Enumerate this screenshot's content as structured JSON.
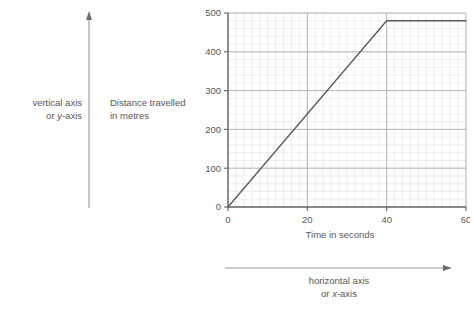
{
  "annotations": {
    "vertical": {
      "line1": "vertical axis",
      "line2_prefix": "or ",
      "line2_italic": "y",
      "line2_suffix": "-axis"
    },
    "horizontal": {
      "line1": "horizontal axis",
      "line2_prefix": "or ",
      "line2_italic": "x",
      "line2_suffix": "-axis"
    },
    "vertical_arrow_icon": "up-arrow-icon",
    "horizontal_arrow_icon": "right-arrow-icon"
  },
  "colors": {
    "text": "#58585b",
    "major_grid": "#b6b6bb",
    "minor_grid": "#e9e9ee",
    "axis": "#6d6d70",
    "series_line": "#58585b",
    "annotation_arrow": "#9a9a9e",
    "background": "#ffffff"
  },
  "chart_data": {
    "type": "line",
    "title": "",
    "xlabel": "Time in seconds",
    "ylabel": "Distance travelled in metres",
    "ylabel_line1": "Distance travelled",
    "ylabel_line2": "in metres",
    "xlim": [
      0,
      60
    ],
    "ylim": [
      0,
      500
    ],
    "xticks": [
      0,
      20,
      40,
      60
    ],
    "xtick_labels": [
      "0",
      "20",
      "40",
      "60"
    ],
    "yticks": [
      0,
      100,
      200,
      300,
      400,
      500
    ],
    "ytick_labels": [
      "0",
      "100",
      "200",
      "300",
      "400",
      "500"
    ],
    "x_minor_step": 2,
    "y_minor_step": 20,
    "grid": true,
    "legend": "none",
    "series": [
      {
        "name": "distance",
        "x": [
          0,
          40,
          60
        ],
        "y": [
          0,
          480,
          480
        ]
      }
    ]
  }
}
